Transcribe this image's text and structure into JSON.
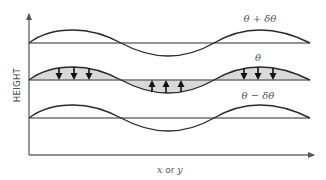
{
  "diagram": {
    "y_axis_label": "HEIGHT",
    "x_axis_label": {
      "var1": "x",
      "conj": " or ",
      "var2": "y"
    },
    "curves": [
      {
        "id": "top",
        "label": "θ + δθ",
        "baseline_y": 43,
        "shaded": false,
        "arrows": []
      },
      {
        "id": "middle",
        "label": "θ",
        "baseline_y": 80,
        "shaded": true,
        "arrows": [
          {
            "group": "left-crest",
            "direction": "down",
            "count": 3
          },
          {
            "group": "trough",
            "direction": "up",
            "count": 3
          },
          {
            "group": "right-crest",
            "direction": "down",
            "count": 3
          }
        ]
      },
      {
        "id": "bottom",
        "label": "θ − δθ",
        "baseline_y": 118,
        "shaded": false,
        "arrows": []
      }
    ],
    "colors": {
      "axis": "#6b6b6b",
      "curve": "#2a2a2a",
      "shading": "#d9d9d9",
      "arrow": "#111111",
      "label": "#555555"
    }
  }
}
